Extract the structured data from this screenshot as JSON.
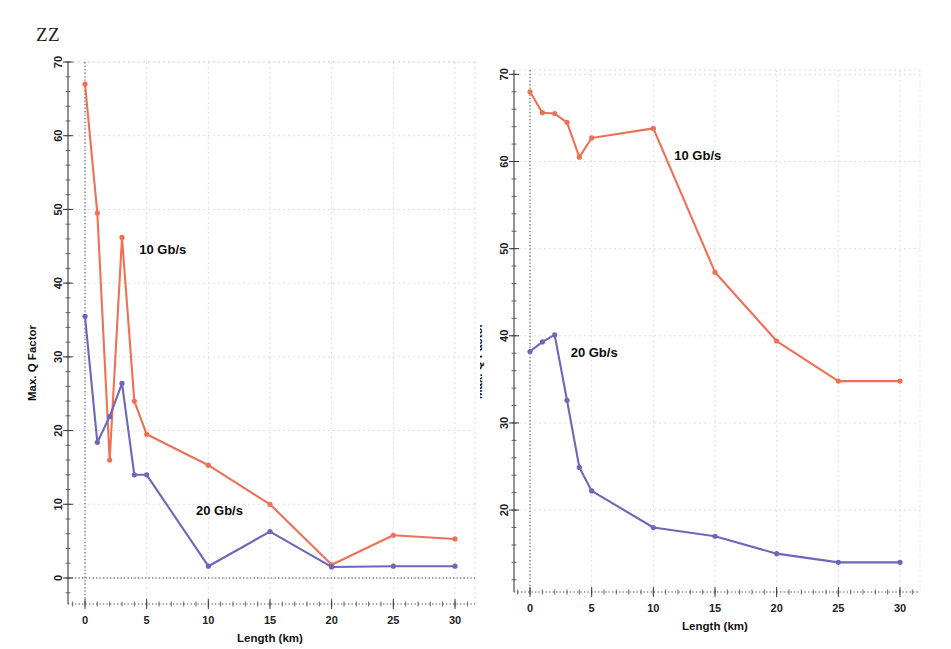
{
  "figure": {
    "label": "ZZ",
    "series_colors": {
      "rate_10": "#ee7156",
      "rate_20": "#6b68b8"
    },
    "grid": true
  },
  "chart_data": [
    {
      "type": "line",
      "panel": "left",
      "title": "",
      "xlabel": "Length (km)",
      "ylabel": "Max. Q Factor",
      "xlim": [
        -1.5,
        31.5
      ],
      "ylim": [
        -3.5,
        70
      ],
      "xticks": [
        0,
        5,
        10,
        15,
        20,
        25,
        30
      ],
      "xticklabels": [
        "0",
        "5",
        "10",
        "15",
        "20",
        "25",
        "30"
      ],
      "yticks": [
        0,
        10,
        20,
        30,
        40,
        50,
        60,
        70
      ],
      "yticklabels": [
        "0",
        "10",
        "20",
        "30",
        "40",
        "50",
        "60",
        "70"
      ],
      "x": [
        0,
        1,
        2,
        3,
        4,
        5,
        10,
        15,
        20,
        25,
        30
      ],
      "series": [
        {
          "name": "10 Gb/s",
          "color": "#ee7156",
          "values": [
            67.0,
            49.5,
            16.0,
            46.2,
            24.0,
            19.5,
            15.3,
            10.0,
            1.8,
            5.8,
            5.3
          ],
          "annotation": {
            "text": "10 Gb/s",
            "x": 4.4,
            "y": 44.0
          }
        },
        {
          "name": "20 Gb/s",
          "color": "#6b68b8",
          "values": [
            35.5,
            18.4,
            21.9,
            26.4,
            14.0,
            14.0,
            1.6,
            6.3,
            1.5,
            1.6,
            1.6
          ],
          "annotation": {
            "text": "20 Gb/s",
            "x": 9.0,
            "y": 8.6
          }
        }
      ]
    },
    {
      "type": "line",
      "panel": "right",
      "title": "",
      "xlabel": "Length (km)",
      "ylabel": "Max. Q Factor",
      "xlim": [
        -1.5,
        31.5
      ],
      "ylim": [
        10.6,
        70.5
      ],
      "xticks": [
        0,
        5,
        10,
        15,
        20,
        25,
        30
      ],
      "xticklabels": [
        "0",
        "5",
        "10",
        "15",
        "20",
        "25",
        "30"
      ],
      "yticks": [
        20,
        30,
        40,
        50,
        60,
        70
      ],
      "yticklabels": [
        "20",
        "30",
        "40",
        "50",
        "60",
        "70"
      ],
      "x": [
        0,
        1,
        2,
        3,
        4,
        5,
        10,
        15,
        20,
        25,
        30
      ],
      "series": [
        {
          "name": "10 Gb/s",
          "color": "#ee7156",
          "values": [
            68.0,
            65.6,
            65.5,
            64.5,
            60.5,
            62.7,
            63.8,
            47.3,
            39.4,
            34.8,
            34.8
          ],
          "annotation": {
            "text": "10 Gb/s",
            "x": 11.7,
            "y": 60.2
          }
        },
        {
          "name": "20 Gb/s",
          "color": "#6b68b8",
          "values": [
            38.2,
            39.3,
            40.1,
            32.6,
            24.9,
            22.2,
            18.0,
            17.0,
            15.0,
            14.0,
            14.0
          ],
          "annotation": {
            "text": "20 Gb/s",
            "x": 3.3,
            "y": 37.6
          }
        }
      ]
    }
  ]
}
